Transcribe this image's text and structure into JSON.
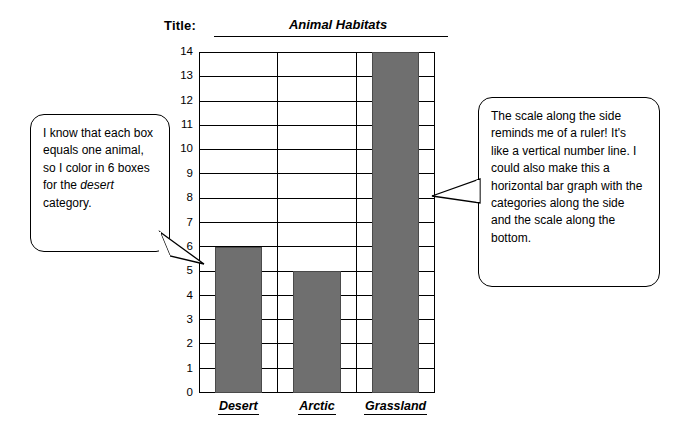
{
  "header": {
    "title_label": "Title:",
    "title_value": "Animal Habitats"
  },
  "callouts": {
    "left": "I know that each box equals one animal, so I color in 6 boxes for the desert category.",
    "left_parts": {
      "p1": "I know that each box equals one animal, so I color in 6 boxes for the ",
      "em": "desert",
      "p2": " category."
    },
    "right": "The scale along the side reminds me of a ruler! It's like a vertical number line.  I could also make this a horizontal bar graph with the categories along the side and the scale along the bottom."
  },
  "chart_data": {
    "type": "bar",
    "title": "Animal Habitats",
    "categories": [
      "Desert",
      "Arctic",
      "Grassland"
    ],
    "values": [
      6,
      5,
      14
    ],
    "xlabel": "",
    "ylabel": "",
    "ylim": [
      0,
      14
    ],
    "yticks": [
      0,
      1,
      2,
      3,
      4,
      5,
      6,
      7,
      8,
      9,
      10,
      11,
      12,
      13,
      14
    ],
    "grid": true,
    "legend": false,
    "bar_color": "#6f6f6f"
  }
}
